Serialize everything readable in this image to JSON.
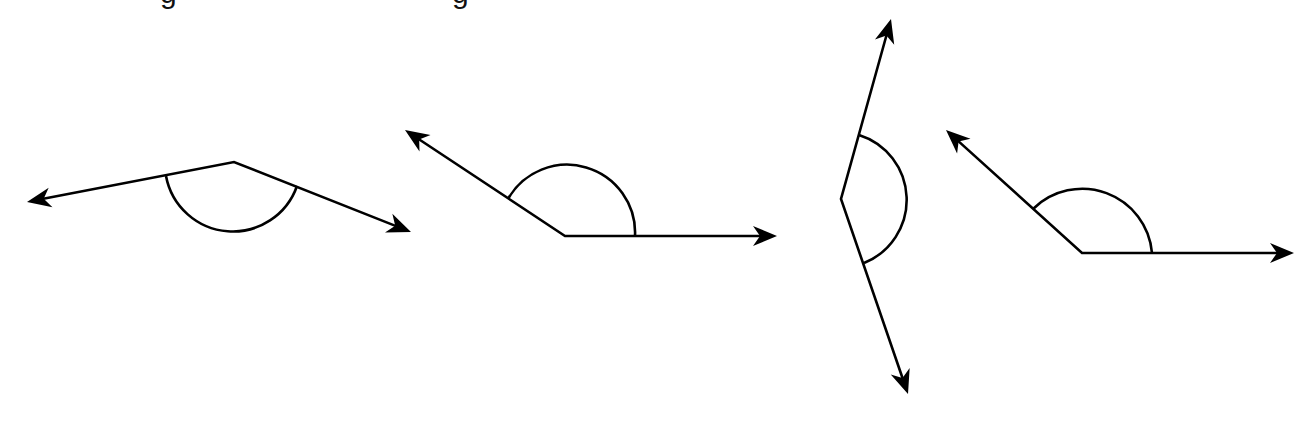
{
  "header": {
    "partial_text_fragments": [
      {
        "text": "g",
        "x": 160
      },
      {
        "text": "g",
        "x": 452
      }
    ],
    "note": "Title text is cropped at top edge; only descenders visible"
  },
  "figure": {
    "stroke_color": "#000000",
    "background_color": "#ffffff",
    "angles": [
      {
        "id": "angle-1",
        "vertex": [
          234,
          162
        ],
        "ray_a_tip": [
          27,
          202
        ],
        "ray_b_tip": [
          411,
          232
        ],
        "arc": {
          "start": [
            166,
            176
          ],
          "end": [
            297,
            186
          ],
          "radius": 68,
          "sweep": 0
        }
      },
      {
        "id": "angle-2",
        "vertex": [
          565,
          236
        ],
        "ray_a_tip": [
          405,
          130
        ],
        "ray_b_tip": [
          777,
          236
        ],
        "arc": {
          "start": [
            508,
            199
          ],
          "end": [
            635,
            236
          ],
          "radius": 68,
          "sweep": 1
        }
      },
      {
        "id": "angle-3",
        "vertex": [
          841,
          199
        ],
        "ray_a_tip": [
          891,
          19
        ],
        "ray_b_tip": [
          908,
          394
        ],
        "arc": {
          "start": [
            859,
            135
          ],
          "end": [
            864,
            263
          ],
          "radius": 68,
          "sweep": 1
        }
      },
      {
        "id": "angle-4",
        "vertex": [
          1082,
          253
        ],
        "ray_a_tip": [
          946,
          130
        ],
        "ray_b_tip": [
          1294,
          253
        ],
        "arc": {
          "start": [
            1033,
            209
          ],
          "end": [
            1152,
            253
          ],
          "radius": 70,
          "sweep": 1
        }
      }
    ]
  }
}
